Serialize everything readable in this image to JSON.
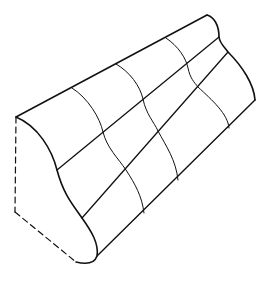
{
  "figure": {
    "stroke_color": "#111111",
    "background": "#ffffff",
    "front_profile": "M16,117 C38,126 52,150 57,170 C64,196 74,206 82,218 C92,232 99,244 97,256 C94,265 84,264 76,262",
    "back_profile": "M207,15 C214,17 219,25 219,37 C220,44 224,46 228,52 C242,66 254,84 255,100",
    "longitudinal_lines": [
      "M16,117 L207,15",
      "M57,170 L219,37",
      "M82,218 L228,52",
      "M97,256 L255,100"
    ],
    "cross_curves": [
      "M72,88 C88,98 100,118 103,132 C107,148 118,158 126,170 C135,184 142,196 144,213",
      "M116,64 C130,72 140,86 143,99 C146,114 154,122 158,131 C166,146 176,160 178,180",
      "M166,38 C178,46 186,58 188,68 C190,78 194,82 198,87 C212,100 228,114 229,128"
    ],
    "hidden_edges": [
      "M16,117 L15,212",
      "M15,212 L76,262"
    ]
  }
}
